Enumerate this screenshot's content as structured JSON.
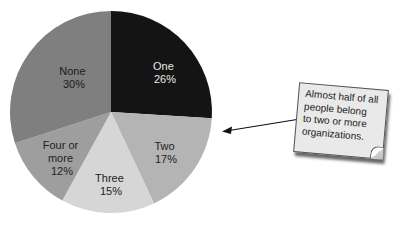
{
  "chart_data": {
    "type": "pie",
    "title": "",
    "categories": [
      "One",
      "Two",
      "Three",
      "Four or more",
      "None"
    ],
    "values": [
      26,
      17,
      15,
      12,
      30
    ],
    "labels": [
      "26%",
      "17%",
      "15%",
      "12%",
      "30%"
    ],
    "colors": [
      "#141414",
      "#b4b4b4",
      "#d6d6d6",
      "#9e9e9e",
      "#7f7f7f"
    ],
    "label_colors": [
      "#e8e8e8",
      "#222222",
      "#222222",
      "#222222",
      "#1a1a1a"
    ],
    "start_angle_deg": 0,
    "direction": "clockwise",
    "legend": "none (labels inside slices)",
    "annotation": {
      "lines": [
        "Almost half of all",
        "people belong",
        "to two or more",
        "organizations."
      ],
      "points_to": "Two"
    }
  },
  "slices": [
    {
      "name_line1": "One",
      "name_line2": "",
      "pct": "26%"
    },
    {
      "name_line1": "Two",
      "name_line2": "",
      "pct": "17%"
    },
    {
      "name_line1": "Three",
      "name_line2": "",
      "pct": "15%"
    },
    {
      "name_line1": "Four or",
      "name_line2": "more",
      "pct": "12%"
    },
    {
      "name_line1": "None",
      "name_line2": "",
      "pct": "30%"
    }
  ],
  "callout": {
    "line1": "Almost half of all",
    "line2": "people belong",
    "line3": "to two or more",
    "line4": "organizations."
  }
}
